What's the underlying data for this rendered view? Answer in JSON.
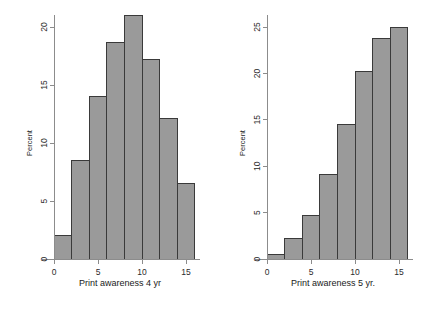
{
  "figure": {
    "background_color": "#ffffff",
    "bar_fill_color": "#9a9a9a",
    "bar_edge_color": "#3a3a3a",
    "axis_color": "#8c8c8c",
    "panels": [
      "left",
      "right"
    ]
  },
  "chart_data": [
    {
      "type": "bar",
      "panel": "left",
      "title": "",
      "xlabel": "Print awareness 4 yr",
      "ylabel": "Percent",
      "grid": false,
      "legend": "none",
      "bin_width": 2,
      "bin_starts": [
        0,
        2,
        4,
        6,
        8,
        10,
        12,
        14
      ],
      "categories": [
        "0-2",
        "2-4",
        "4-6",
        "6-8",
        "8-10",
        "10-12",
        "12-14",
        "14-16"
      ],
      "values": [
        2.0,
        8.5,
        14.0,
        18.7,
        21.0,
        17.2,
        12.1,
        6.5
      ],
      "xlim": [
        -1.2,
        16.6
      ],
      "ylim": [
        0,
        22.3
      ],
      "xticks": [
        0,
        5,
        10,
        15
      ],
      "xticklabels": [
        "0",
        "5",
        "10",
        "15"
      ],
      "yticks": [
        0,
        5,
        10,
        15,
        20
      ],
      "yticklabels": [
        "0",
        "5",
        "10",
        "15",
        "20"
      ]
    },
    {
      "type": "bar",
      "panel": "right",
      "title": "",
      "xlabel": "Print awareness 5 yr.",
      "ylabel": "Percent",
      "grid": false,
      "legend": "none",
      "bin_width": 2,
      "bin_starts": [
        0,
        2,
        4,
        6,
        8,
        10,
        12,
        14
      ],
      "categories": [
        "0-2",
        "2-4",
        "4-6",
        "6-8",
        "8-10",
        "10-12",
        "12-14",
        "14-16"
      ],
      "values": [
        0.5,
        2.2,
        4.7,
        9.1,
        14.5,
        20.2,
        23.8,
        24.9
      ],
      "xlim": [
        -1.2,
        16.6
      ],
      "ylim": [
        0,
        26.4
      ],
      "xticks": [
        0,
        5,
        10,
        15
      ],
      "xticklabels": [
        "0",
        "5",
        "10",
        "15"
      ],
      "yticks": [
        0,
        5,
        10,
        15,
        20,
        25
      ],
      "yticklabels": [
        "0",
        "5",
        "10",
        "15",
        "20",
        "25"
      ]
    }
  ]
}
